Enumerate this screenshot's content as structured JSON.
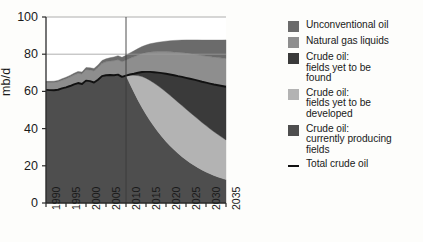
{
  "axes": {
    "ylabel": "mb/d",
    "yticks": [
      0,
      20,
      40,
      60,
      80,
      100
    ],
    "xticks": [
      1990,
      1995,
      2000,
      2005,
      2010,
      2015,
      2020,
      2025,
      2030,
      2035
    ]
  },
  "legend": {
    "items": [
      {
        "name": "unconventional-oil",
        "label_lines": [
          "Unconventional oil"
        ],
        "color": "#6b6b6b",
        "marker": "swatch"
      },
      {
        "name": "natural-gas-liquids",
        "label_lines": [
          "Natural gas liquids"
        ],
        "color": "#8e8e8e",
        "marker": "swatch"
      },
      {
        "name": "crude-oil-yet-to-be-found",
        "label_lines": [
          "Crude oil:",
          "fields yet to be",
          "found"
        ],
        "color": "#3a3a3a",
        "marker": "swatch"
      },
      {
        "name": "crude-oil-yet-to-be-developed",
        "label_lines": [
          "Crude oil:",
          "fields yet to be",
          "developed"
        ],
        "color": "#b3b3b3",
        "marker": "swatch"
      },
      {
        "name": "crude-oil-currently-producing",
        "label_lines": [
          "Crude oil:",
          "currently producing",
          "fields"
        ],
        "color": "#4e4e4e",
        "marker": "swatch"
      },
      {
        "name": "total-crude-oil",
        "label_lines": [
          "Total crude oil"
        ],
        "color": "#111111",
        "marker": "line"
      }
    ]
  },
  "chart_data": {
    "type": "area",
    "title": "",
    "xlabel": "",
    "ylabel": "mb/d",
    "xlim": [
      1990,
      2035
    ],
    "ylim": [
      0,
      100
    ],
    "grid": "horizontal",
    "stacked": true,
    "divider_x": 2010,
    "x": [
      1990,
      1991,
      1992,
      1993,
      1994,
      1995,
      1996,
      1997,
      1998,
      1999,
      2000,
      2001,
      2002,
      2003,
      2004,
      2005,
      2006,
      2007,
      2008,
      2009,
      2010,
      2011,
      2012,
      2013,
      2014,
      2015,
      2016,
      2017,
      2018,
      2019,
      2020,
      2021,
      2022,
      2023,
      2024,
      2025,
      2026,
      2027,
      2028,
      2029,
      2030,
      2031,
      2032,
      2033,
      2034,
      2035
    ],
    "series": [
      {
        "name": "Crude oil: currently producing fields",
        "color": "#4e4e4e",
        "values": [
          60.8,
          60.7,
          60.6,
          60.9,
          61.6,
          62.2,
          62.9,
          63.8,
          64.5,
          64.0,
          65.8,
          65.5,
          64.8,
          66.3,
          68.2,
          68.7,
          68.8,
          68.7,
          69.0,
          67.8,
          68.5,
          64.0,
          59.5,
          55.3,
          51.4,
          47.7,
          44.3,
          41.2,
          38.3,
          35.6,
          33.1,
          30.8,
          28.7,
          26.7,
          24.9,
          23.2,
          21.7,
          20.3,
          19.0,
          17.8,
          16.7,
          15.7,
          14.8,
          14.0,
          13.3,
          12.6
        ]
      },
      {
        "name": "Crude oil: fields yet to be developed",
        "color": "#b3b3b3",
        "values": [
          0,
          0,
          0,
          0,
          0,
          0,
          0,
          0,
          0,
          0,
          0,
          0,
          0,
          0,
          0,
          0,
          0,
          0,
          0,
          0,
          0,
          4.8,
          9.2,
          13.2,
          16.6,
          19.4,
          21.6,
          23.3,
          24.7,
          25.8,
          26.6,
          27.1,
          27.4,
          27.5,
          27.5,
          27.3,
          27.0,
          26.6,
          26.1,
          25.5,
          24.9,
          24.2,
          23.5,
          22.8,
          22.0,
          21.3
        ]
      },
      {
        "name": "Crude oil: fields yet to be found",
        "color": "#3a3a3a",
        "values": [
          0,
          0,
          0,
          0,
          0,
          0,
          0,
          0,
          0,
          0,
          0,
          0,
          0,
          0,
          0,
          0,
          0,
          0,
          0,
          0,
          0,
          0.3,
          0.8,
          1.5,
          2.4,
          3.4,
          4.6,
          5.8,
          7.1,
          8.4,
          9.8,
          11.2,
          12.6,
          14.0,
          15.4,
          16.8,
          18.1,
          19.4,
          20.7,
          21.9,
          23.1,
          24.3,
          25.4,
          26.5,
          27.6,
          28.6
        ]
      },
      {
        "name": "Natural gas liquids",
        "color": "#8e8e8e",
        "values": [
          4.0,
          4.1,
          4.2,
          4.3,
          4.4,
          4.6,
          4.8,
          5.0,
          5.2,
          5.4,
          5.9,
          6.0,
          6.2,
          6.5,
          6.9,
          7.2,
          7.5,
          7.8,
          8.0,
          8.1,
          8.3,
          8.7,
          9.1,
          9.5,
          9.9,
          10.3,
          10.7,
          11.0,
          11.3,
          11.6,
          11.9,
          12.2,
          12.5,
          12.8,
          13.0,
          13.3,
          13.5,
          13.7,
          13.9,
          14.1,
          14.3,
          14.5,
          14.7,
          14.9,
          15.0,
          15.2
        ]
      },
      {
        "name": "Unconventional oil",
        "color": "#6b6b6b",
        "values": [
          0.6,
          0.6,
          0.7,
          0.7,
          0.8,
          0.8,
          0.9,
          0.9,
          1.0,
          1.0,
          1.1,
          1.2,
          1.3,
          1.4,
          1.5,
          1.6,
          1.8,
          2.0,
          2.2,
          2.4,
          2.6,
          2.9,
          3.2,
          3.5,
          3.8,
          4.1,
          4.4,
          4.7,
          5.0,
          5.3,
          5.6,
          5.9,
          6.2,
          6.5,
          6.8,
          7.1,
          7.4,
          7.7,
          8.0,
          8.3,
          8.6,
          8.9,
          9.2,
          9.4,
          9.7,
          10.0
        ]
      }
    ],
    "line_series": {
      "name": "Total crude oil",
      "color": "#111111",
      "values": [
        60.8,
        60.7,
        60.6,
        60.9,
        61.6,
        62.2,
        62.9,
        63.8,
        64.5,
        64.0,
        65.8,
        65.5,
        64.8,
        66.3,
        68.2,
        68.7,
        68.8,
        68.7,
        69.0,
        67.8,
        68.5,
        69.1,
        69.5,
        70.0,
        70.4,
        70.5,
        70.5,
        70.3,
        70.1,
        69.8,
        69.5,
        69.1,
        68.7,
        68.2,
        67.8,
        67.3,
        66.8,
        66.3,
        65.8,
        65.2,
        64.7,
        64.2,
        63.7,
        63.3,
        62.9,
        62.5
      ]
    }
  }
}
